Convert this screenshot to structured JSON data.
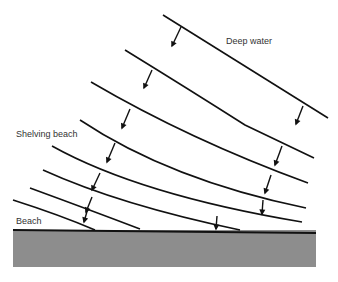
{
  "diagram": {
    "labels": {
      "deep_water": "Deep water",
      "shelving_beach": "Shelving beach",
      "beach": "Beach"
    },
    "colors": {
      "line": "#111111",
      "ground": "#8d8d8d",
      "ground_edge": "#111111",
      "text": "#333333",
      "background": "#ffffff"
    },
    "wave_crests": [
      {
        "id": "crest-1",
        "path": "M163,15 L328,118",
        "arrows": [
          [
            181,
            27,
            172,
            46
          ],
          [
            303,
            106,
            296,
            124
          ]
        ]
      },
      {
        "id": "crest-2",
        "path": "M125,50 Q190,90 245,125 L314,158",
        "arrows": [
          [
            152,
            70,
            144,
            88
          ],
          [
            282,
            146,
            275,
            165
          ]
        ]
      },
      {
        "id": "crest-3",
        "path": "M91,82 Q190,140 308,183",
        "arrows": [
          [
            130,
            109,
            122,
            128
          ],
          [
            271,
            175,
            265,
            193
          ]
        ]
      },
      {
        "id": "crest-4",
        "path": "M80,120 Q170,180 306,208",
        "arrows": [
          [
            115,
            143,
            107,
            162
          ],
          [
            263,
            200,
            262,
            214
          ]
        ]
      },
      {
        "id": "crest-5",
        "path": "M52,146 Q140,195 302,222",
        "arrows": [
          [
            100,
            173,
            92,
            190
          ]
        ]
      },
      {
        "id": "crest-6",
        "path": "M43,170 Q120,205 240,230",
        "arrows": [
          [
            92,
            197,
            86,
            212
          ]
        ]
      },
      {
        "id": "crest-7",
        "path": "M30,188 Q90,210 140,229",
        "arrows": [
          [
            88,
            208,
            84,
            222
          ]
        ]
      },
      {
        "id": "crest-8",
        "path": "M13,200 Q60,215 95,230",
        "arrows": [
          [
            217,
            216,
            216,
            229
          ]
        ]
      }
    ],
    "ground": {
      "x": 13,
      "y": 230,
      "width": 303,
      "height": 37
    }
  }
}
